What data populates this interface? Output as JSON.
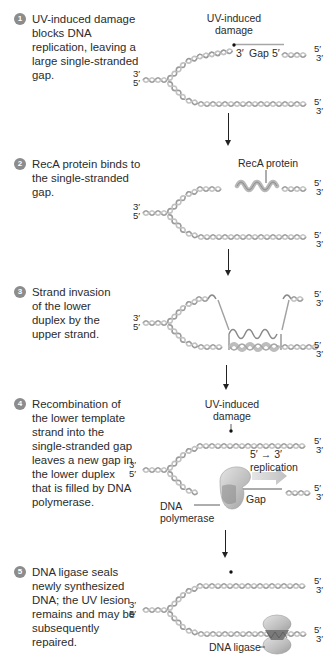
{
  "figure": {
    "colors": {
      "helix": "#a8a8a8",
      "helix_dark": "#7d7d7d",
      "reca": "#b9b9b9",
      "step_circle": "#8c8c8c",
      "text": "#2b2b2b",
      "replication_arrow": "#c9c9c9",
      "enzyme": "#c4c4c4"
    }
  },
  "steps": [
    {
      "number": "1",
      "text": "UV-induced damage blocks DNA replication, leaving a large single-stranded gap.",
      "labels": {
        "damage": "UV-induced damage",
        "gap_3": "3′",
        "gap": "Gap",
        "gap_5": "5′"
      },
      "ends": {
        "left_top": "3′",
        "left_bottom": "5′",
        "upper_right_top": "5′",
        "upper_right_bottom": "3′",
        "lower_right_top": "5′",
        "lower_right_bottom": "3′"
      }
    },
    {
      "number": "2",
      "text": "RecA protein binds to the single-stranded gap.",
      "labels": {
        "reca": "RecA protein"
      },
      "ends": {
        "left_top": "3′",
        "left_bottom": "5′",
        "upper_right_top": "5′",
        "upper_right_bottom": "3′",
        "lower_right_top": "5′",
        "lower_right_bottom": "3′"
      }
    },
    {
      "number": "3",
      "text": "Strand invasion of the lower duplex by the upper strand.",
      "labels": {},
      "ends": {
        "left_top": "3′",
        "left_bottom": "5′",
        "upper_right_top": "5′",
        "upper_right_bottom": "3′",
        "lower_right_top": "5′",
        "lower_right_bottom": "3′"
      }
    },
    {
      "number": "4",
      "text": "Recombination of the lower template strand into the single-stranded gap leaves a new gap in the lower duplex that is filled by DNA polymerase.",
      "labels": {
        "damage": "UV-induced damage",
        "direction": "5′ → 3′",
        "replication": "replication",
        "gap": "Gap",
        "polymerase": "DNA polymerase"
      },
      "ends": {
        "left_top": "3′",
        "left_bottom": "5′",
        "upper_right_top": "5′",
        "upper_right_bottom": "3′",
        "lower_right_top": "5′",
        "lower_right_bottom": "3′"
      }
    },
    {
      "number": "5",
      "text": "DNA ligase seals newly synthesized DNA; the UV lesion remains and may be subsequently repaired.",
      "labels": {
        "ligase": "DNA ligase"
      },
      "ends": {
        "left_top": "3′",
        "left_bottom": "5′",
        "upper_right_top": "5′",
        "upper_right_bottom": "3′",
        "lower_right_top": "5′",
        "lower_right_bottom": "3′"
      }
    }
  ]
}
